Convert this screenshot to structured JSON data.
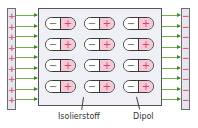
{
  "diagram": {
    "left_plate": {
      "charge_symbol": "+",
      "count": 9,
      "color": "#d85c82"
    },
    "right_plate": {
      "charge_symbol": "−",
      "count": 9,
      "color": "#d85c82"
    },
    "field_arrows": {
      "count_per_side": 9,
      "color": "#3f8a2a"
    },
    "dipole": {
      "neg_symbol": "−",
      "pos_symbol": "+",
      "rows": 4,
      "cols": 3,
      "pos_color": "#f6c9d6"
    },
    "labels": {
      "insulator": "Isolierstoff",
      "dipole": "Dipol"
    }
  }
}
